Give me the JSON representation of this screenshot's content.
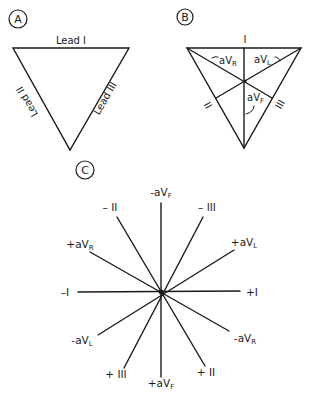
{
  "panels": {
    "A": {
      "badge": "A",
      "leads": {
        "lead1": "Lead I",
        "lead2": "Lead II",
        "lead3": "Lead III"
      }
    },
    "B": {
      "badge": "B",
      "side_labels": {
        "top": "I",
        "left": "II",
        "right": "III"
      },
      "axis_labels": {
        "avr": {
          "main": "aV",
          "sub": "R",
          "prefix": "-"
        },
        "avl": {
          "main": "aV",
          "sub": "L"
        },
        "avf": {
          "main": "aV",
          "sub": "F"
        }
      }
    },
    "C": {
      "badge": "C",
      "axes": [
        {
          "id": "minus-avf",
          "main": "-aV",
          "sub": "F"
        },
        {
          "id": "minus-ii",
          "main": "– II",
          "sub": ""
        },
        {
          "id": "minus-iii",
          "main": "– III",
          "sub": ""
        },
        {
          "id": "plus-avr",
          "main": "+aV",
          "sub": "R"
        },
        {
          "id": "plus-avl",
          "main": "+aV",
          "sub": "L"
        },
        {
          "id": "minus-i",
          "main": "–I",
          "sub": ""
        },
        {
          "id": "plus-i",
          "main": "+I",
          "sub": ""
        },
        {
          "id": "minus-avl",
          "main": "-aV",
          "sub": "L"
        },
        {
          "id": "minus-avr",
          "main": "-aV",
          "sub": "R"
        },
        {
          "id": "plus-iii",
          "main": "+ III",
          "sub": ""
        },
        {
          "id": "plus-avf",
          "main": "+aV",
          "sub": "F"
        },
        {
          "id": "plus-ii",
          "main": "+ II",
          "sub": ""
        }
      ]
    }
  }
}
